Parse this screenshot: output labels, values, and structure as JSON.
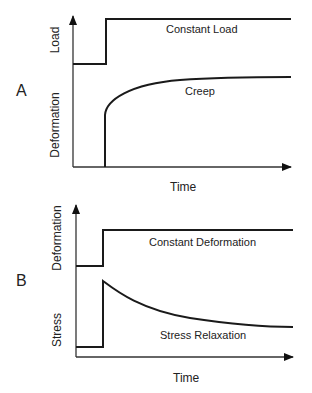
{
  "panels": [
    {
      "id": "A",
      "label": "A",
      "upper_ylabel": "Load",
      "lower_ylabel": "Deformation",
      "xlabel": "Time",
      "upper_curve_label": "Constant Load",
      "lower_curve_label": "Creep"
    },
    {
      "id": "B",
      "label": "B",
      "upper_ylabel": "Deformation",
      "lower_ylabel": "Stress",
      "xlabel": "Time",
      "upper_curve_label": "Constant Deformation",
      "lower_curve_label": "Stress Relaxation"
    }
  ],
  "colors": {
    "line": "#1a1a1a",
    "axis": "#333333",
    "text": "#222222"
  }
}
